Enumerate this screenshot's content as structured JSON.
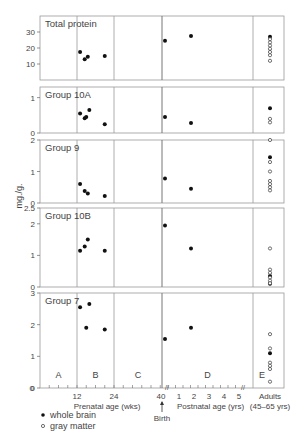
{
  "chart_data": {
    "type": "scatter",
    "ylabel": "mg./g.",
    "x_axis": {
      "prenatal_label": "Prenatal age (wks)",
      "prenatal_ticks": [
        "12",
        "24",
        "40"
      ],
      "postnatal_label": "Postnatal age (yrs)",
      "postnatal_ticks": [
        "1",
        "2",
        "3",
        "4",
        "5"
      ],
      "adults_label": "Adults",
      "adults_range": "(45–65 yrs)",
      "birth_label": "Birth",
      "zero_label": "0"
    },
    "periods": [
      "A",
      "B",
      "C",
      "D",
      "E"
    ],
    "legend": [
      {
        "marker": "filled",
        "label": "whole brain"
      },
      {
        "marker": "open",
        "label": "gray matter"
      }
    ],
    "panels": [
      {
        "title": "Total protein",
        "ylim": [
          0,
          40
        ],
        "yticks": [
          "10",
          "20",
          "30"
        ],
        "whole_brain": [
          [
            13,
            17.5
          ],
          [
            14.5,
            13
          ],
          [
            15.5,
            14.5
          ],
          [
            21,
            15
          ],
          [
            "birth+0.2y",
            24.5
          ],
          [
            "2y",
            27.5
          ],
          [
            "adult",
            27
          ]
        ],
        "gray_matter_adult": [
          25.5,
          23.5,
          21.5,
          19.5,
          17.5,
          15.5,
          12
        ]
      },
      {
        "title": "Group 10A",
        "ylim": [
          0,
          1.3
        ],
        "yticks": [
          "0",
          "1"
        ],
        "whole_brain": [
          [
            13,
            0.55
          ],
          [
            14.5,
            0.42
          ],
          [
            15,
            0.45
          ],
          [
            16,
            0.65
          ],
          [
            21,
            0.25
          ],
          [
            "birth+0.2y",
            0.45
          ],
          [
            "2y",
            0.28
          ],
          [
            "adult",
            0.7
          ]
        ],
        "gray_matter_adult": [
          0.4,
          0.3
        ]
      },
      {
        "title": "Group 9",
        "ylim": [
          0,
          2
        ],
        "yticks": [
          "0",
          "1",
          "2"
        ],
        "whole_brain": [
          [
            13,
            0.6
          ],
          [
            14.5,
            0.38
          ],
          [
            15.5,
            0.3
          ],
          [
            21,
            0.22
          ],
          [
            "birth+0.2y",
            0.78
          ],
          [
            "2y",
            0.45
          ],
          [
            "adult",
            1.45
          ]
        ],
        "gray_matter_adult": [
          2.0,
          1.3,
          1.0,
          0.7,
          0.6,
          0.5,
          0.4
        ]
      },
      {
        "title": "Group 10B",
        "ylim": [
          0,
          2.5
        ],
        "yticks": [
          "0",
          "1",
          "2",
          "2.5"
        ],
        "whole_brain": [
          [
            13,
            1.15
          ],
          [
            14.5,
            1.28
          ],
          [
            15.5,
            1.5
          ],
          [
            21,
            1.15
          ],
          [
            "birth+0.2y",
            1.95
          ],
          [
            "2y",
            1.22
          ],
          [
            "adult",
            0.35
          ],
          [
            "adult",
            0.1
          ]
        ],
        "gray_matter_adult": [
          1.22,
          0.55,
          0.45,
          0.3,
          0.2,
          0.12
        ]
      },
      {
        "title": "Group 7",
        "ylim": [
          0,
          3
        ],
        "yticks": [
          "0",
          "1",
          "2",
          "3"
        ],
        "whole_brain": [
          [
            13,
            2.55
          ],
          [
            15,
            1.9
          ],
          [
            16,
            2.65
          ],
          [
            21,
            1.85
          ],
          [
            "birth+0.2y",
            1.55
          ],
          [
            "2y",
            1.9
          ],
          [
            "adult",
            1.1
          ]
        ],
        "gray_matter_adult": [
          1.7,
          1.25,
          0.8,
          0.7,
          0.6,
          0.2
        ]
      }
    ]
  }
}
